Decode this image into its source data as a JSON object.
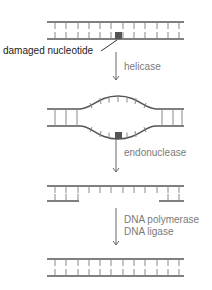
{
  "colors": {
    "strand": "#555555",
    "rung": "#888888",
    "damage": "#555555",
    "arrow": "#666666",
    "label": "#7a7a7a",
    "callout": "#222222"
  },
  "callout": {
    "text": "damaged nucleotide"
  },
  "steps": [
    {
      "id": "helicase",
      "lines": [
        "helicase"
      ]
    },
    {
      "id": "endonuclease",
      "lines": [
        "endonuclease"
      ]
    },
    {
      "id": "polymerase-ligase",
      "lines": [
        "DNA polymerase",
        "DNA ligase"
      ]
    }
  ],
  "stages": [
    {
      "id": "damaged-dna",
      "state": "intact double strand with damaged nucleotide"
    },
    {
      "id": "unwound-bubble",
      "state": "strands separated around damage"
    },
    {
      "id": "excised-gap",
      "state": "damaged segment removed from bottom strand"
    },
    {
      "id": "repaired-dna",
      "state": "gap filled and sealed"
    }
  ]
}
